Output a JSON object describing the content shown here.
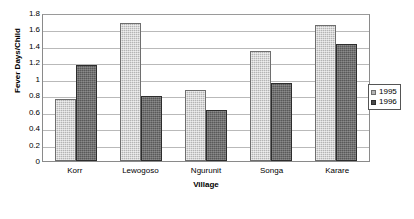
{
  "chart_data": {
    "type": "bar",
    "title": "",
    "xlabel": "Village",
    "ylabel": "Fever Days/Child",
    "categories": [
      "Korr",
      "Lewogoso",
      "Ngurunit",
      "Songa",
      "Karare"
    ],
    "series": [
      {
        "name": "1995",
        "color": "#b4b4b4",
        "values": [
          0.75,
          1.68,
          0.86,
          1.34,
          1.65
        ]
      },
      {
        "name": "1996",
        "color": "#595959",
        "values": [
          1.17,
          0.79,
          0.62,
          0.95,
          1.42
        ]
      }
    ],
    "ylim": [
      0,
      1.8
    ],
    "ytick_labels": [
      "1.8",
      "1.6",
      "1.4",
      "1.2",
      "1",
      "0.8",
      "0.6",
      "0.4",
      "0.2",
      "0"
    ],
    "ytick_values": [
      1.8,
      1.6,
      1.4,
      1.2,
      1.0,
      0.8,
      0.6,
      0.4,
      0.2,
      0
    ],
    "grid": true,
    "legend_position": "right"
  },
  "legend": {
    "entries": [
      {
        "label": "1995"
      },
      {
        "label": "1996"
      }
    ]
  }
}
